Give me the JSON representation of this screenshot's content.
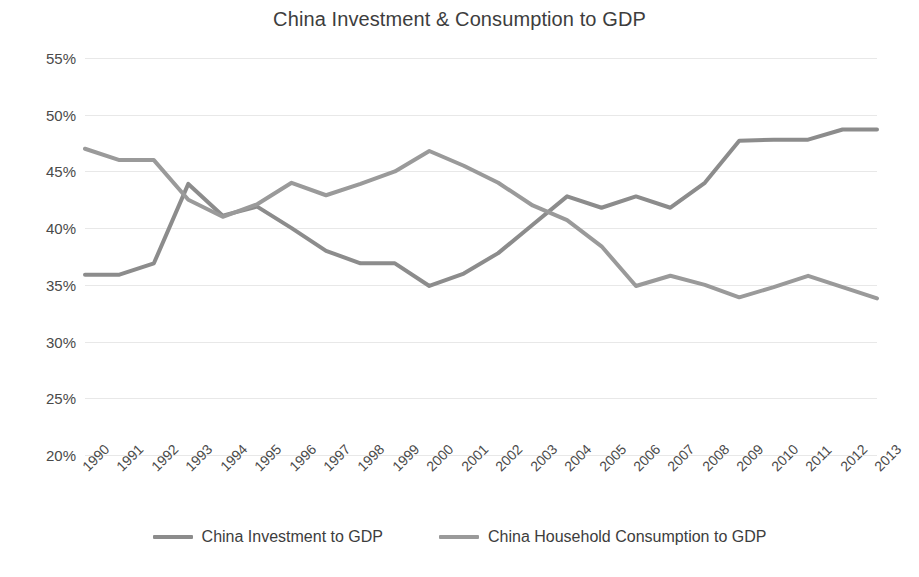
{
  "chart_data": {
    "type": "line",
    "title": "China Investment & Consumption to GDP",
    "xlabel": "",
    "ylabel": "",
    "ylim": [
      20,
      55
    ],
    "ytick_labels": [
      "55%",
      "50%",
      "45%",
      "40%",
      "35%",
      "30%",
      "25%",
      "20%"
    ],
    "ytick_values": [
      55,
      50,
      45,
      40,
      35,
      30,
      25,
      20
    ],
    "grid": true,
    "legend_position": "bottom",
    "categories": [
      "1990",
      "1991",
      "1992",
      "1993",
      "1994",
      "1995",
      "1996",
      "1997",
      "1998",
      "1999",
      "2000",
      "2001",
      "2002",
      "2003",
      "2004",
      "2005",
      "2006",
      "2007",
      "2008",
      "2009",
      "2010",
      "2011",
      "2012",
      "2013"
    ],
    "series": [
      {
        "name": "China Investment to GDP",
        "color": "#8c8c8c",
        "values": [
          35.9,
          35.9,
          36.9,
          43.9,
          41.1,
          41.9,
          40.0,
          38.0,
          36.9,
          36.9,
          34.9,
          36.0,
          37.8,
          40.3,
          42.8,
          41.8,
          42.8,
          41.8,
          44.0,
          47.7,
          47.8,
          47.8,
          48.7,
          48.7
        ]
      },
      {
        "name": "China Household Consumption to GDP",
        "color": "#9a9a9a",
        "values": [
          47.0,
          46.0,
          46.0,
          42.5,
          41.0,
          42.1,
          44.0,
          42.9,
          43.9,
          45.0,
          46.8,
          45.5,
          44.0,
          42.0,
          40.7,
          38.4,
          34.9,
          35.8,
          35.0,
          33.9,
          34.8,
          35.8,
          34.8,
          33.8
        ]
      }
    ]
  },
  "legend": {
    "items": [
      {
        "label": "China Investment to GDP",
        "color": "#8c8c8c"
      },
      {
        "label": "China Household Consumption to GDP",
        "color": "#9a9a9a"
      }
    ]
  }
}
